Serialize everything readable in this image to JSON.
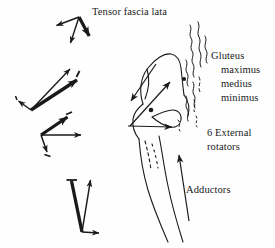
{
  "figure": {
    "background_color": "#fefefe",
    "ink_color": "#1a1a1a",
    "width": 275,
    "height": 248
  },
  "labels": {
    "tensor_fascia_lata": "Tensor fascia lata",
    "gluteus": "Gluteus",
    "gluteus_maximus": "maximus",
    "gluteus_medius": "medius",
    "gluteus_minimus": "minimus",
    "external_rotators_line1": "6 External",
    "external_rotators_line2": "rotators",
    "adductors": "Adductors"
  },
  "muscle_groups": [
    {
      "name": "Tensor fascia lata",
      "label_position": {
        "x": 92,
        "y": 7
      },
      "vector_cluster": {
        "id": "cluster-tensor-fascia-lata",
        "apex": {
          "x": 79,
          "y": 17
        },
        "arrows": [
          {
            "from": {
              "x": 79,
              "y": 17
            },
            "to": {
              "x": 55,
              "y": 26
            },
            "weight": "thin"
          },
          {
            "from": {
              "x": 79,
              "y": 17
            },
            "to": {
              "x": 70,
              "y": 45
            },
            "weight": "thin"
          },
          {
            "from": {
              "x": 79,
              "y": 17
            },
            "to": {
              "x": 90,
              "y": 38
            },
            "weight": "thick"
          }
        ]
      }
    },
    {
      "name": "Gluteus maximus / medius / minimus",
      "label_position": {
        "x": 211,
        "y": 51
      },
      "vector_cluster": {
        "id": "cluster-gluteus",
        "apex": {
          "x": 31,
          "y": 110
        },
        "arrows": [
          {
            "from": {
              "x": 31,
              "y": 110
            },
            "to": {
              "x": 17,
              "y": 100
            },
            "weight": "thin"
          },
          {
            "from": {
              "x": 31,
              "y": 110
            },
            "to": {
              "x": 72,
              "y": 67
            },
            "weight": "thin"
          },
          {
            "from": {
              "x": 31,
              "y": 110
            },
            "to": {
              "x": 79,
              "y": 78
            },
            "weight": "thick"
          }
        ]
      }
    },
    {
      "name": "6 External rotators",
      "label_position": {
        "x": 207,
        "y": 128
      },
      "vector_cluster": {
        "id": "cluster-external-rotators",
        "apex": {
          "x": 41,
          "y": 135
        },
        "arrows": [
          {
            "from": {
              "x": 41,
              "y": 135
            },
            "to": {
              "x": 84,
              "y": 135
            },
            "weight": "thin"
          },
          {
            "from": {
              "x": 41,
              "y": 135
            },
            "to": {
              "x": 48,
              "y": 155
            },
            "weight": "thin"
          },
          {
            "from": {
              "x": 41,
              "y": 135
            },
            "to": {
              "x": 69,
              "y": 115
            },
            "weight": "thick"
          }
        ]
      }
    },
    {
      "name": "Adductors",
      "label_position": {
        "x": 186,
        "y": 185
      },
      "vector_cluster": {
        "id": "cluster-adductors",
        "apex": {
          "x": 82,
          "y": 232
        },
        "arrows": [
          {
            "from": {
              "x": 82,
              "y": 232
            },
            "to": {
              "x": 71,
              "y": 178
            },
            "weight": "thick"
          },
          {
            "from": {
              "x": 82,
              "y": 232
            },
            "to": {
              "x": 91,
              "y": 177
            },
            "weight": "thin"
          },
          {
            "from": {
              "x": 82,
              "y": 232
            },
            "to": {
              "x": 102,
              "y": 233
            },
            "weight": "thin"
          }
        ]
      }
    }
  ],
  "anatomy": {
    "structure": "proximal femur",
    "features": [
      "greater trochanter",
      "femoral head and neck",
      "lesser trochanter",
      "femoral shaft",
      "acetabulum / pelvic bone margin with muscle attachment hatching"
    ]
  },
  "pointer_arrows": [
    {
      "name": "gluteus-attachment-pointer",
      "from": {
        "x": 130,
        "y": 125
      },
      "to": {
        "x": 172,
        "y": 80
      }
    },
    {
      "name": "abductor-direction-pointer",
      "from": {
        "x": 155,
        "y": 65
      },
      "to": {
        "x": 130,
        "y": 103
      }
    },
    {
      "name": "external-rotator-pointer",
      "from": {
        "x": 128,
        "y": 126
      },
      "to": {
        "x": 175,
        "y": 127
      }
    },
    {
      "name": "adductor-pointer",
      "from": {
        "x": 188,
        "y": 220
      },
      "to": {
        "x": 178,
        "y": 152
      }
    }
  ]
}
